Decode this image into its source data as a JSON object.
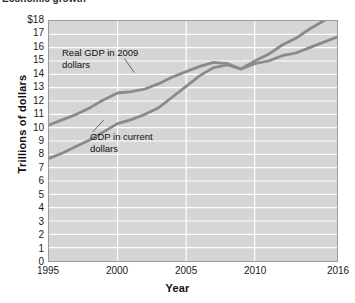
{
  "caption": {
    "text": "Economic growth"
  },
  "chart_data": {
    "type": "line",
    "title": "",
    "xlabel": "Year",
    "ylabel": "Trillions of dollars",
    "grid": true,
    "legend_position": "inline-annotations",
    "xlim": [
      1995,
      2016
    ],
    "ylim": [
      0,
      18
    ],
    "xticks": [
      "1995",
      "2000",
      "2005",
      "2010",
      "2016"
    ],
    "xtick_values": [
      1995,
      2000,
      2005,
      2010,
      2016
    ],
    "yticks": [
      "0",
      "1",
      "2",
      "3",
      "4",
      "5",
      "6",
      "7",
      "8",
      "9",
      "10",
      "11",
      "12",
      "13",
      "14",
      "15",
      "16",
      "17",
      "$18"
    ],
    "ytick_values": [
      0,
      1,
      2,
      3,
      4,
      5,
      6,
      7,
      8,
      9,
      10,
      11,
      12,
      13,
      14,
      15,
      16,
      17,
      18
    ],
    "x": [
      1995,
      1996,
      1997,
      1998,
      1999,
      2000,
      2001,
      2002,
      2003,
      2004,
      2005,
      2006,
      2007,
      2008,
      2009,
      2010,
      2011,
      2012,
      2013,
      2014,
      2015,
      2016
    ],
    "series": [
      {
        "name": "GDP in current dollars",
        "color": "#8a8a8a",
        "values": [
          7.7,
          8.1,
          8.6,
          9.1,
          9.7,
          10.3,
          10.6,
          11.0,
          11.5,
          12.3,
          13.1,
          13.9,
          14.5,
          14.7,
          14.4,
          15.0,
          15.5,
          16.2,
          16.7,
          17.4,
          18.0,
          18.7
        ]
      },
      {
        "name": "Real GDP in 2009 dollars",
        "color": "#8a8a8a",
        "values": [
          10.2,
          10.6,
          11.0,
          11.5,
          12.1,
          12.6,
          12.7,
          12.9,
          13.3,
          13.8,
          14.2,
          14.6,
          14.9,
          14.8,
          14.4,
          14.8,
          15.0,
          15.4,
          15.6,
          16.0,
          16.4,
          16.8
        ]
      }
    ],
    "annotations": [
      {
        "name": "real-gdp-label",
        "text": "Real GDP in 2009\ndollars"
      },
      {
        "name": "current-gdp-label",
        "text": "GDP in current\ndollars"
      }
    ],
    "colors": {
      "plot_background": "#d5d5d5",
      "gridline": "#ffffff",
      "line": "#8a8a8a",
      "axis": "#9a9a9a",
      "text": "#1a1a1a"
    }
  }
}
